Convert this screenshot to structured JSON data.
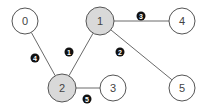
{
  "diagram": {
    "type": "graph",
    "nodes": [
      {
        "id": "0",
        "label": "0",
        "x": 25,
        "y": 21,
        "r": 13,
        "fill": "#ffffff"
      },
      {
        "id": "1",
        "label": "1",
        "x": 100,
        "y": 21,
        "r": 14,
        "fill": "#d9d9d9"
      },
      {
        "id": "4",
        "label": "4",
        "x": 182,
        "y": 21,
        "r": 13,
        "fill": "#ffffff"
      },
      {
        "id": "2",
        "label": "2",
        "x": 62,
        "y": 88,
        "r": 14,
        "fill": "#d9d9d9"
      },
      {
        "id": "3",
        "label": "3",
        "x": 113,
        "y": 88,
        "r": 13,
        "fill": "#ffffff"
      },
      {
        "id": "5",
        "label": "5",
        "x": 182,
        "y": 88,
        "r": 13,
        "fill": "#ffffff"
      }
    ],
    "edges": [
      {
        "from": "1",
        "to": "2",
        "label": "1",
        "lx": 69,
        "ly": 52
      },
      {
        "from": "1",
        "to": "5",
        "label": "2",
        "lx": 120,
        "ly": 52
      },
      {
        "from": "1",
        "to": "4",
        "label": "3",
        "lx": 141,
        "ly": 16
      },
      {
        "from": "0",
        "to": "2",
        "label": "4",
        "lx": 35,
        "ly": 58
      },
      {
        "from": "2",
        "to": "3",
        "label": "5",
        "lx": 87,
        "ly": 99
      }
    ]
  }
}
